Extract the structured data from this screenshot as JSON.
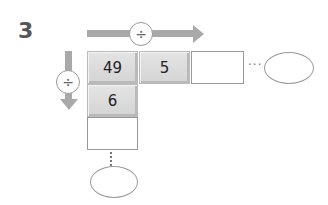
{
  "question": {
    "number": "3"
  },
  "operators": {
    "horizontal": "÷",
    "vertical": "÷"
  },
  "grid": {
    "row": [
      "49",
      "5",
      ""
    ],
    "column": [
      "49",
      "6",
      ""
    ]
  },
  "cells": {
    "top_left": "49",
    "top_middle": "5",
    "left_middle": "6"
  },
  "continuation": {
    "horizontal": "···",
    "vertical": "⋮"
  },
  "answers": {
    "horizontal_result": "",
    "vertical_result": ""
  }
}
